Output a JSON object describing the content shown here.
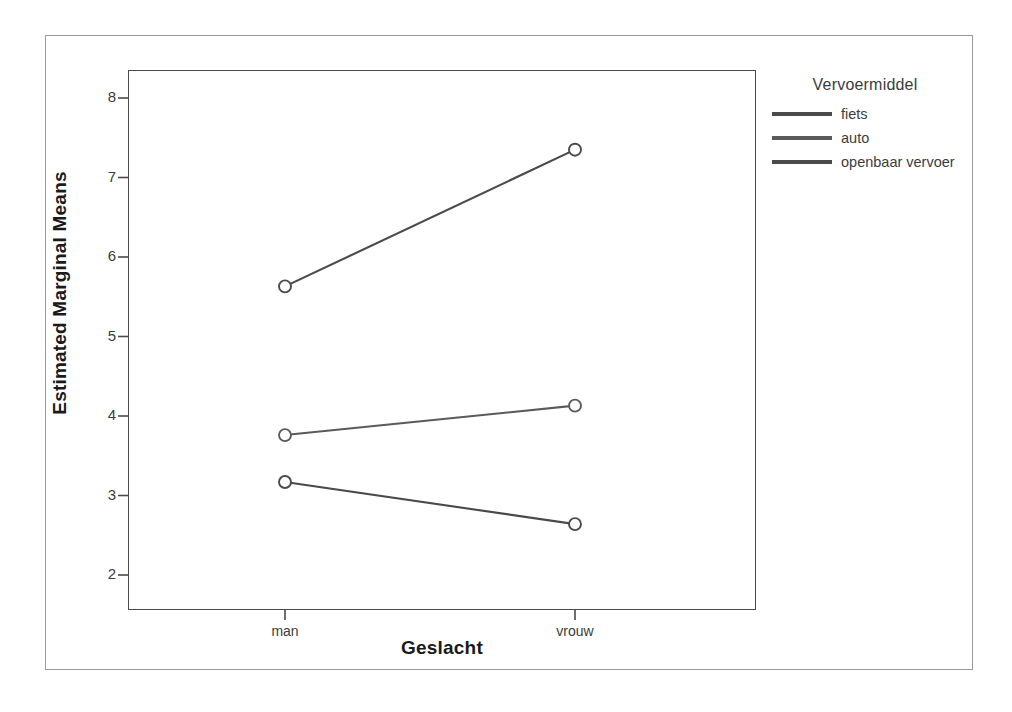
{
  "chart_data": {
    "type": "line",
    "title": "",
    "xlabel": "Geslacht",
    "ylabel": "Estimated Marginal Means",
    "categories": [
      "man",
      "vrouw"
    ],
    "ylim": [
      1.6,
      8.4
    ],
    "yticks": [
      2,
      3,
      4,
      5,
      6,
      7,
      8
    ],
    "grid": false,
    "legend_position": "right",
    "legend_title": "Vervoermiddel",
    "series": [
      {
        "name": "fiets",
        "values": [
          5.63,
          7.35
        ],
        "color": "#4a4a4a"
      },
      {
        "name": "auto",
        "values": [
          3.76,
          4.13
        ],
        "color": "#5a5a5a"
      },
      {
        "name": "openbaar vervoer",
        "values": [
          3.17,
          2.64
        ],
        "color": "#4a4a4a"
      }
    ]
  },
  "axes": {
    "y_title": "Estimated Marginal Means",
    "x_title": "Geslacht",
    "y_tick_labels": [
      "8",
      "7",
      "6",
      "5",
      "4",
      "3",
      "2"
    ],
    "x_tick_labels": [
      "man",
      "vrouw"
    ]
  },
  "legend": {
    "title": "Vervoermiddel",
    "items": [
      {
        "label": "fiets"
      },
      {
        "label": "auto"
      },
      {
        "label": "openbaar vervoer"
      }
    ]
  },
  "colors": {
    "line": "#4a4a4a",
    "frame": "#4a4a4a",
    "outer_border": "#9a9a9a",
    "text": "#3c3c3c",
    "title_text": "#1a1a1a"
  }
}
